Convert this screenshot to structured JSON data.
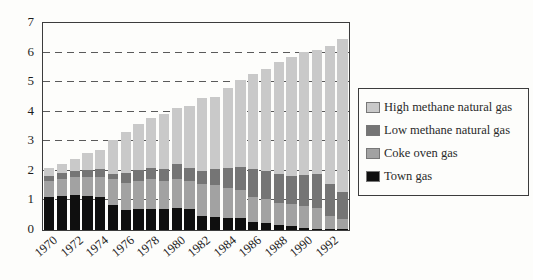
{
  "chart_data": {
    "type": "bar",
    "stacked": true,
    "title": "",
    "xlabel": "",
    "ylabel": "",
    "ylim": [
      0,
      7
    ],
    "yticks": [
      "0",
      "1",
      "2",
      "3",
      "4",
      "5",
      "6",
      "7"
    ],
    "grid": {
      "horizontal_dashed_levels": [
        1,
        2,
        3,
        4,
        5,
        6
      ]
    },
    "categories": [
      1970,
      1971,
      1972,
      1973,
      1974,
      1975,
      1976,
      1977,
      1978,
      1979,
      1980,
      1981,
      1982,
      1983,
      1984,
      1985,
      1986,
      1987,
      1988,
      1989,
      1990,
      1991,
      1992,
      1993
    ],
    "x_tick_labels": [
      "1970",
      "1972",
      "1974",
      "1976",
      "1978",
      "1980",
      "1982",
      "1984",
      "1986",
      "1988",
      "1990",
      "1992"
    ],
    "x_tick_every": 2,
    "series": [
      {
        "name": "Town gas",
        "color": "#0f0f0f",
        "values": [
          1.12,
          1.16,
          1.18,
          1.16,
          1.1,
          0.85,
          0.68,
          0.7,
          0.7,
          0.72,
          0.74,
          0.7,
          0.47,
          0.44,
          0.4,
          0.4,
          0.27,
          0.23,
          0.16,
          0.12,
          0.08,
          0.05,
          0.03,
          0.02
        ]
      },
      {
        "name": "Coke oven gas",
        "color": "#a2a2a2",
        "values": [
          0.53,
          0.56,
          0.6,
          0.64,
          0.7,
          0.86,
          0.92,
          0.96,
          1.01,
          0.94,
          0.97,
          0.96,
          1.07,
          1.07,
          1.03,
          0.97,
          0.86,
          0.81,
          0.76,
          0.75,
          0.73,
          0.7,
          0.44,
          0.34
        ]
      },
      {
        "name": "Low methane natural gas",
        "color": "#757575",
        "values": [
          0.17,
          0.2,
          0.21,
          0.22,
          0.25,
          0.17,
          0.34,
          0.37,
          0.4,
          0.41,
          0.51,
          0.45,
          0.45,
          0.54,
          0.68,
          0.77,
          0.92,
          0.95,
          0.96,
          0.95,
          1.04,
          1.13,
          1.07,
          0.93
        ]
      },
      {
        "name": "High methane natural gas",
        "color": "#c9c9c9",
        "values": [
          0.28,
          0.33,
          0.41,
          0.58,
          0.67,
          1.15,
          1.36,
          1.54,
          1.69,
          1.85,
          1.9,
          2.09,
          2.48,
          2.45,
          2.68,
          2.95,
          3.23,
          3.44,
          3.8,
          4.04,
          4.16,
          4.2,
          4.68,
          5.16
        ]
      }
    ],
    "legend": {
      "position": "right",
      "items_top_to_bottom": [
        {
          "label": "High methane natural gas",
          "color": "#c9c9c9"
        },
        {
          "label": "Low methane natural gas",
          "color": "#757575"
        },
        {
          "label": "Coke oven gas",
          "color": "#a2a2a2"
        },
        {
          "label": "Town gas",
          "color": "#0f0f0f"
        }
      ]
    }
  }
}
